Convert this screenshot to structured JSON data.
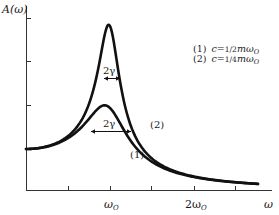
{
  "chart_data": {
    "type": "line",
    "title": "",
    "xlabel": "ω",
    "ylabel": "A(ω)",
    "x_tick_labels": [
      {
        "label": "ω_O",
        "value": 1.0
      },
      {
        "label": "2ω_O",
        "value": 2.0
      }
    ],
    "x_ticks": [
      0.5,
      1.0,
      1.5,
      2.0,
      2.5
    ],
    "y_ticks_relative_to_A0": [
      1.0,
      2.0,
      3.0,
      4.0
    ],
    "xlim": [
      0,
      2.75
    ],
    "ylim_relative_to_A0": [
      0,
      4.6
    ],
    "grid": false,
    "legend_position": "upper right",
    "model": "A(ω) = F / sqrt((ω0² − ω²)² + (c·ω/m)²), ω0 = 1",
    "series": [
      {
        "name": "(1)",
        "legend": "(1) c = 1/2 m ω_O",
        "damping_c_over_m": 0.5,
        "peak_x": 1.0,
        "peak_relative_to_A0": 2.0,
        "x": [
          0,
          0.25,
          0.5,
          0.75,
          0.9,
          1.0,
          1.1,
          1.25,
          1.5,
          2.0,
          2.5,
          2.75
        ],
        "values": [
          1.0,
          1.06,
          1.26,
          1.67,
          1.93,
          2.0,
          1.86,
          1.51,
          0.94,
          0.43,
          0.24,
          0.19
        ]
      },
      {
        "name": "(2)",
        "legend": "(2) c = 1/4 m ω_O",
        "damping_c_over_m": 0.25,
        "peak_x": 1.0,
        "peak_relative_to_A0": 4.0,
        "x": [
          0,
          0.25,
          0.5,
          0.75,
          0.9,
          1.0,
          1.1,
          1.25,
          1.5,
          2.0,
          2.5,
          2.75
        ],
        "values": [
          1.0,
          1.06,
          1.31,
          2.08,
          3.34,
          4.0,
          3.1,
          1.89,
          0.97,
          0.33,
          0.19,
          0.15
        ]
      }
    ],
    "annotations": [
      {
        "text": "2γ",
        "type": "double-arrow width marker",
        "on": "(2)",
        "at": "half-width"
      },
      {
        "text": "2γ",
        "type": "double-arrow width marker",
        "on": "(1)",
        "at": "half-width"
      },
      {
        "text": "(1)",
        "on": "curve (1)"
      },
      {
        "text": "(2)",
        "on": "curve (2)"
      }
    ]
  },
  "labels": {
    "y_axis": "A(ω)",
    "x_axis": "ω",
    "x_tick_1": "ω",
    "x_tick_1_sub": "O",
    "x_tick_2": "2ω",
    "x_tick_2_sub": "O",
    "gamma_upper": "2γ",
    "gamma_lower": "2γ",
    "curve1_tag": "(1)",
    "curve2_tag": "(2)",
    "legend": [
      {
        "num": "(1)",
        "c": "c",
        "eq": "=",
        "frac": "1/2",
        "m": "m",
        "omega": "ω",
        "sub": "O"
      },
      {
        "num": "(2)",
        "c": "c",
        "eq": "=",
        "frac": "1/4",
        "m": "m",
        "omega": "ω",
        "sub": "O"
      }
    ]
  }
}
